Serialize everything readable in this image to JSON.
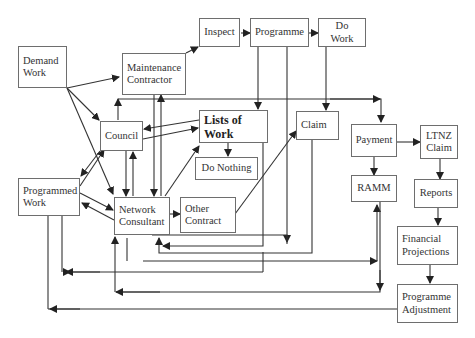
{
  "diagram": {
    "nodes": {
      "demand_work": "Demand Work",
      "maintenance_contractor": "Maintenance Contractor",
      "inspect": "Inspect",
      "programme": "Programme",
      "do_work": "Do Work",
      "council": "Council",
      "lists_of_work": "Lists of Work",
      "do_nothing": "Do Nothing",
      "claim": "Claim",
      "payment": "Payment",
      "ltnz_claim": "LTNZ Claim",
      "programmed_work": "Programmed Work",
      "network_consultant": "Network Consultant",
      "other_contract": "Other Contract",
      "ramm": "RAMM",
      "reports": "Reports",
      "financial_projections": "Financial Projections",
      "programme_adjustment": "Programme Adjustment"
    },
    "edges": [
      [
        "Demand Work",
        "Maintenance Contractor"
      ],
      [
        "Demand Work",
        "Council"
      ],
      [
        "Demand Work",
        "Network Consultant"
      ],
      [
        "Maintenance Contractor",
        "Inspect"
      ],
      [
        "Inspect",
        "Programme"
      ],
      [
        "Programme",
        "Do Work"
      ],
      [
        "Programme",
        "Lists of Work"
      ],
      [
        "Do Work",
        "Claim"
      ],
      [
        "Council",
        "Maintenance Contractor"
      ],
      [
        "Council",
        "Payment"
      ],
      [
        "Council",
        "Lists of Work"
      ],
      [
        "Lists of Work",
        "Council"
      ],
      [
        "Lists of Work",
        "Do Nothing"
      ],
      [
        "Council",
        "Network Consultant"
      ],
      [
        "Network Consultant",
        "Council"
      ],
      [
        "Council",
        "Programmed Work"
      ],
      [
        "Programmed Work",
        "Council"
      ],
      [
        "Maintenance Contractor",
        "Network Consultant"
      ],
      [
        "Network Consultant",
        "Maintenance Contractor"
      ],
      [
        "Network Consultant",
        "Lists of Work"
      ],
      [
        "Programmed Work",
        "Network Consultant"
      ],
      [
        "Network Consultant",
        "Programmed Work"
      ],
      [
        "Network Consultant",
        "Other Contract"
      ],
      [
        "Other Contract",
        "Claim"
      ],
      [
        "Payment",
        "LTNZ Claim"
      ],
      [
        "Payment",
        "RAMM"
      ],
      [
        "LTNZ Claim",
        "Reports"
      ],
      [
        "Reports",
        "Financial Projections"
      ],
      [
        "Financial Projections",
        "Programme Adjustment"
      ],
      [
        "Programme Adjustment",
        "Programmed Work"
      ],
      [
        "RAMM",
        "Network Consultant"
      ],
      [
        "Network Consultant",
        "RAMM"
      ]
    ]
  }
}
